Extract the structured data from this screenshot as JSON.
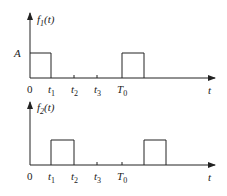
{
  "diagram": {
    "panels": [
      {
        "id": "f1",
        "ylabel_base": "f",
        "ylabel_sub": "1",
        "ylabel_arg": "(t)",
        "amplitude_label": "A",
        "xlabel": "t",
        "ticks": [
          "0",
          "t1",
          "t2",
          "t3",
          "T0"
        ],
        "tick_labels": [
          {
            "base": "0",
            "sub": ""
          },
          {
            "base": "t",
            "sub": "1"
          },
          {
            "base": "t",
            "sub": "2"
          },
          {
            "base": "t",
            "sub": "3"
          },
          {
            "base": "T",
            "sub": "0"
          }
        ],
        "pulses": [
          {
            "start": "0",
            "end": "t1"
          },
          {
            "start": "T0",
            "end": "T0+t1"
          }
        ]
      },
      {
        "id": "f2",
        "ylabel_base": "f",
        "ylabel_sub": "2",
        "ylabel_arg": "(t)",
        "xlabel": "t",
        "ticks": [
          "0",
          "t1",
          "t2",
          "t3",
          "T0"
        ],
        "tick_labels": [
          {
            "base": "0",
            "sub": ""
          },
          {
            "base": "t",
            "sub": "1"
          },
          {
            "base": "t",
            "sub": "2"
          },
          {
            "base": "t",
            "sub": "3"
          },
          {
            "base": "T",
            "sub": "0"
          }
        ],
        "pulses": [
          {
            "start": "t1",
            "end": "t2"
          },
          {
            "start": "T0+t1",
            "end": "T0+t2"
          }
        ]
      }
    ],
    "line_color": "#222222"
  }
}
